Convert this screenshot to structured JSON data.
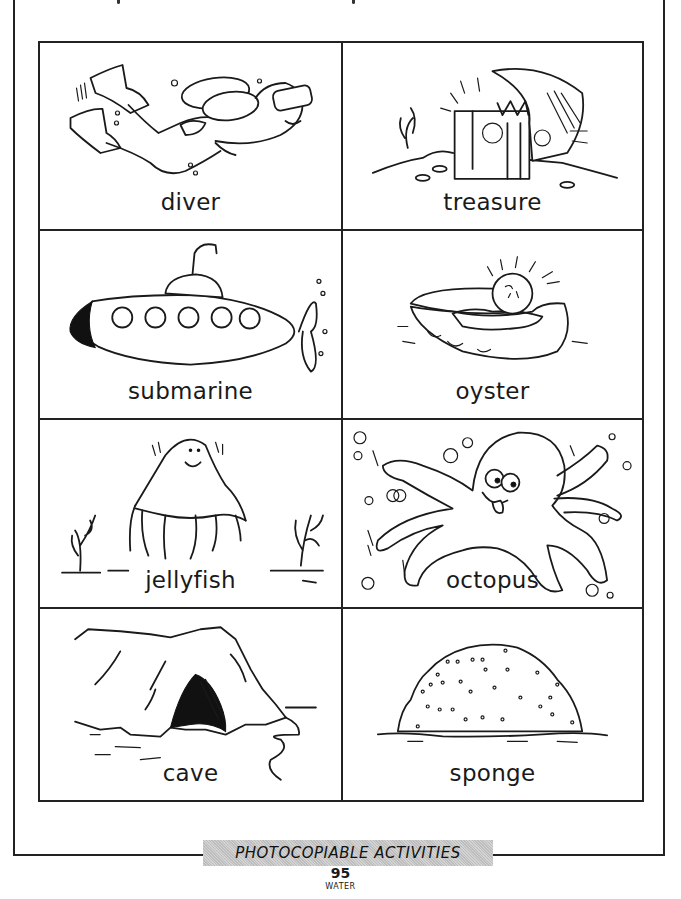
{
  "worksheet": {
    "cards": [
      {
        "label": "diver",
        "icon": "diver-icon"
      },
      {
        "label": "treasure",
        "icon": "treasure-chest-icon"
      },
      {
        "label": "submarine",
        "icon": "submarine-icon"
      },
      {
        "label": "oyster",
        "icon": "oyster-pearl-icon"
      },
      {
        "label": "jellyfish",
        "icon": "jellyfish-icon"
      },
      {
        "label": "octopus",
        "icon": "octopus-icon"
      },
      {
        "label": "cave",
        "icon": "cave-icon"
      },
      {
        "label": "sponge",
        "icon": "sponge-icon"
      }
    ]
  },
  "footer": {
    "banner": "PHOTOCOPIABLE ACTIVITIES",
    "page_number": "95",
    "section": "WATER"
  },
  "colors": {
    "ink": "#1a1a1a",
    "banner_gray": "#c8c8c8",
    "paper": "#ffffff"
  }
}
